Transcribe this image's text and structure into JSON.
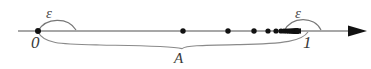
{
  "figure": {
    "labels": {
      "epsilon_left": "ε",
      "epsilon_right": "ε",
      "zero": "0",
      "one": "1",
      "set_a": "A"
    },
    "colors": {
      "line": "#8a8a8a",
      "point": "#111111",
      "arc": "#777777",
      "brace": "#8a8a8a",
      "text": "#3a3a3a",
      "background": "#ffffff"
    },
    "axis": {
      "y": 31,
      "x_start": 18,
      "x_end": 365,
      "zero_x": 38,
      "one_x": 308,
      "arrowhead": "right-arrow"
    },
    "points": {
      "zero_point_x": 38,
      "sequence_x": [
        183,
        228,
        254,
        268,
        276,
        281,
        284,
        286.5,
        288.5,
        290,
        291.2,
        292.2,
        293,
        293.7,
        294.3,
        294.8,
        295.2,
        295.6,
        296,
        296.3,
        296.6,
        296.9,
        297.1,
        297.3,
        297.5
      ],
      "limit_x": 298,
      "radius": 2.6,
      "description": "sequence of points accumulating at 1"
    },
    "epsilon_arcs": {
      "left": {
        "from_x": 38,
        "to_x": 75,
        "peak_y": 20
      },
      "right": {
        "from_x": 286,
        "to_x": 320,
        "peak_y": 20
      }
    },
    "brace": {
      "left_x": 38,
      "right_x": 308,
      "mid_x": 184,
      "top_y": 33,
      "bottom_y": 46,
      "tip_y": 49
    }
  }
}
